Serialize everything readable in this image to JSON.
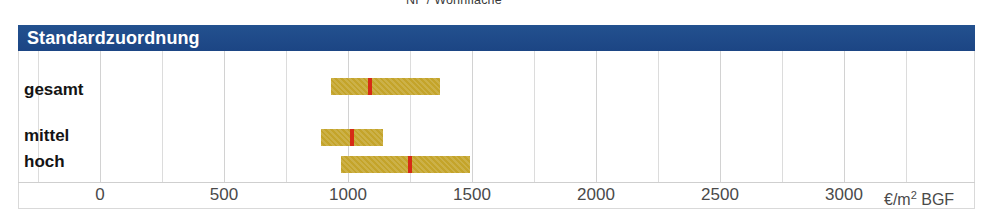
{
  "top_caption": "NF / Wohnfläche",
  "header": {
    "title": "Standardzuordnung",
    "color": "#1e4a8a"
  },
  "axis": {
    "unit_label_prefix": "€/m",
    "unit_label_sup": "2",
    "unit_label_suffix": " BGF",
    "ticks": [
      "0",
      "500",
      "1000",
      "1500",
      "2000",
      "2500",
      "3000"
    ]
  },
  "rows": [
    {
      "label": "gesamt"
    },
    {
      "label": "mittel"
    },
    {
      "label": "hoch"
    }
  ],
  "colors": {
    "bar": "#c4a42a",
    "marker": "#d62b16",
    "header": "#1e4a8a",
    "grid": "#dcdcdc"
  },
  "chart_data": {
    "type": "bar",
    "title": "Standardzuordnung",
    "subtitle": "NF / Wohnfläche",
    "orientation": "horizontal",
    "xlabel": "€/m2 BGF",
    "ylabel": "",
    "xlim": [
      0,
      3250
    ],
    "xticks": [
      0,
      500,
      1000,
      1500,
      2000,
      2500,
      3000
    ],
    "grid": true,
    "legend": null,
    "categories": [
      "gesamt",
      "mittel",
      "hoch"
    ],
    "series": [
      {
        "name": "Spannweite",
        "type": "range",
        "values": [
          {
            "category": "gesamt",
            "low": 930,
            "high": 1370,
            "marker": 1090
          },
          {
            "category": "mittel",
            "low": 890,
            "high": 1140,
            "marker": 1015
          },
          {
            "category": "hoch",
            "low": 970,
            "high": 1490,
            "marker": 1250
          }
        ]
      }
    ]
  }
}
